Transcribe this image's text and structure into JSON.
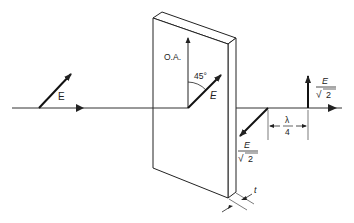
{
  "diagram": {
    "labels": {
      "incident_field": "E",
      "optic_axis": "O.A.",
      "angle": "45°",
      "field_in_plate": "E",
      "component_numerator": "E",
      "component_denominator": "2",
      "sqrt_symbol": "√",
      "phase_offset_numerator": "λ",
      "phase_offset_denominator": "4",
      "thickness": "t"
    },
    "elements": [
      "incident beam with linear polarization E",
      "birefringent plate of thickness t",
      "optic axis (O.A.) vertical",
      "E at 45° to optic axis",
      "output components E/√2 separated by λ/4"
    ],
    "colors": {
      "line": "#222222",
      "background": "#ffffff"
    }
  }
}
